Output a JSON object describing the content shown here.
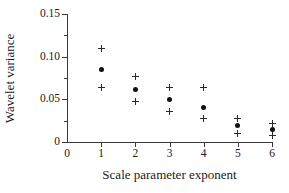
{
  "chart_data": {
    "type": "scatter",
    "title": "",
    "xlabel": "Scale parameter exponent",
    "ylabel": "Wavelet variance",
    "xlim": [
      0,
      6
    ],
    "ylim": [
      0,
      0.15
    ],
    "grid": false,
    "legend": null,
    "x_ticks": [
      "0",
      "1",
      "2",
      "3",
      "4",
      "5",
      "6"
    ],
    "x_tick_values": [
      0,
      1,
      2,
      3,
      4,
      5,
      6
    ],
    "y_ticks": [
      "0",
      "0.05",
      "0.10",
      "0.15"
    ],
    "y_tick_values": [
      0,
      0.05,
      0.1,
      0.15
    ],
    "y_minor_tick_values": [
      0.025,
      0.075,
      0.125
    ],
    "x": [
      1,
      2,
      3,
      4,
      5,
      6
    ],
    "series": [
      {
        "name": "Wavelet variance estimate",
        "marker": "filled-circle",
        "color": "#101010",
        "values": [
          0.0855,
          0.0612,
          0.0502,
          0.04,
          0.019,
          0.0145
        ]
      },
      {
        "name": "Upper confidence limit",
        "marker": "plus",
        "color": "#2a2a2a",
        "values": [
          0.11,
          0.0762,
          0.0642,
          0.0642,
          0.028,
          0.0222
        ]
      },
      {
        "name": "Lower confidence limit",
        "marker": "plus",
        "color": "#2a2a2a",
        "values": [
          0.0642,
          0.048,
          0.0352,
          0.0281,
          0.0105,
          0.0082
        ]
      }
    ]
  },
  "axis": {
    "x_title": "Scale parameter exponent",
    "y_title": "Wavelet variance"
  }
}
